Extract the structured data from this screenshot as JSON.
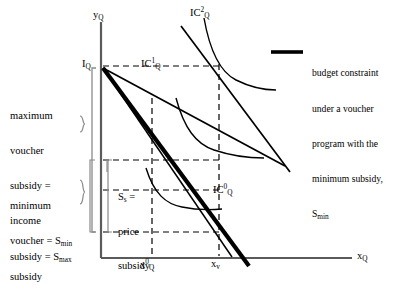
{
  "figure": {
    "type": "economics-indifference-curve-diagram",
    "axes": {
      "y_axis_label": "y",
      "y_axis_label_sub": "Q",
      "x_axis_label": "x",
      "x_axis_label_sub": "Q"
    },
    "points": {
      "income_intercept": {
        "label": "I",
        "sub": "Q"
      },
      "x_opt_quantity": {
        "label": "x",
        "sup": "0",
        "sub": "Q"
      },
      "x_voucher_quantity": {
        "label": "x",
        "sub": "v"
      }
    },
    "curves": [
      {
        "name": "IC0",
        "label": "IC",
        "sup": "0",
        "sub": "Q"
      },
      {
        "name": "IC1",
        "label": "IC",
        "sup": "1",
        "sub": "Q"
      },
      {
        "name": "IC2",
        "label": "IC",
        "sup": "2",
        "sub": "Q"
      }
    ],
    "annotations": {
      "max_subsidy": {
        "line1": "maximum",
        "line2": "voucher",
        "line3": "subsidy =",
        "line4": "income",
        "line5_pre": "subsidy = S",
        "line5_sub": "max"
      },
      "min_subsidy": {
        "line1": "minimum",
        "line2_pre": "voucher = S",
        "line2_sub": "min",
        "line3": "subsidy"
      },
      "price_subsidy": {
        "line1_pre": "S",
        "line1_sub": "s",
        "line1_post": " =",
        "line2": "price",
        "line3": "subsidy"
      }
    }
  },
  "legend": {
    "swatch": "thick-line-swatch",
    "text_line1": "budget constraint",
    "text_line2": "under a voucher",
    "text_line3": "program with the",
    "text_line4": "minimum subsidy,",
    "text_line5_pre": "S",
    "text_line5_sub": "min"
  },
  "colors": {
    "ink": "#000000",
    "axis": "#5a5a5a",
    "bracket": "#8a8a8a",
    "background": "#ffffff"
  }
}
